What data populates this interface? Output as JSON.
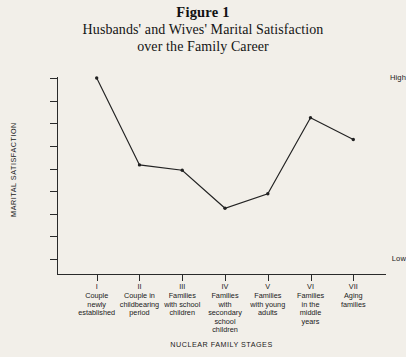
{
  "figure": {
    "number": "Figure 1",
    "caption_line1": "Husbands' and Wives' Marital Satisfaction",
    "caption_line2": "over the Family Career"
  },
  "axis": {
    "y_title": "MARITAL SATISFACTION",
    "y_high_label": "High",
    "y_low_label": "Low",
    "x_title": "NUCLEAR FAMILY STAGES"
  },
  "categories": [
    {
      "roman": "I",
      "text": "Couple\nnewly\nestablished"
    },
    {
      "roman": "II",
      "text": "Couple in\nchildbearing\nperiod"
    },
    {
      "roman": "III",
      "text": "Families\nwith school\nchildren"
    },
    {
      "roman": "IV",
      "text": "Families\nwith\nsecondary\nschool\nchildren"
    },
    {
      "roman": "V",
      "text": "Families\nwith young\nadults"
    },
    {
      "roman": "VI",
      "text": "Families\nin the\nmiddle\nyears"
    },
    {
      "roman": "VII",
      "text": "Aging\nfamilies"
    }
  ],
  "colors": {
    "background": "#f2efe9",
    "ink": "#1a1a1a",
    "line": "#222222"
  },
  "chart_data": {
    "type": "line",
    "title": "Husbands' and Wives' Marital Satisfaction over the Family Career",
    "subtitle": "Figure 1",
    "xlabel": "NUCLEAR FAMILY STAGES",
    "ylabel": "MARITAL SATISFACTION",
    "ylim": [
      0,
      100
    ],
    "ytick_labels": [
      "Low",
      "",
      "",
      "",
      "",
      "",
      "",
      "",
      "High"
    ],
    "ytick_count": 9,
    "grid": false,
    "legend": false,
    "markers": true,
    "categories": [
      "I Couple newly established",
      "II Couple in childbearing period",
      "III Families with school children",
      "IV Families with secondary school children",
      "V Families with young adults",
      "VI Families in the middle years",
      "VII Aging families"
    ],
    "series": [
      {
        "name": "Marital Satisfaction",
        "values": [
          100,
          52,
          49,
          28,
          36,
          78,
          66
        ]
      }
    ]
  }
}
